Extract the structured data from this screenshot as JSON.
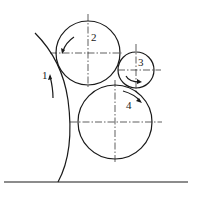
{
  "diagram": {
    "labels": {
      "surface": "1",
      "roller_top": "2",
      "roller_small": "3",
      "roller_bottom": "4"
    },
    "colors": {
      "line": "#1a1a1a",
      "background": "#ffffff"
    }
  }
}
